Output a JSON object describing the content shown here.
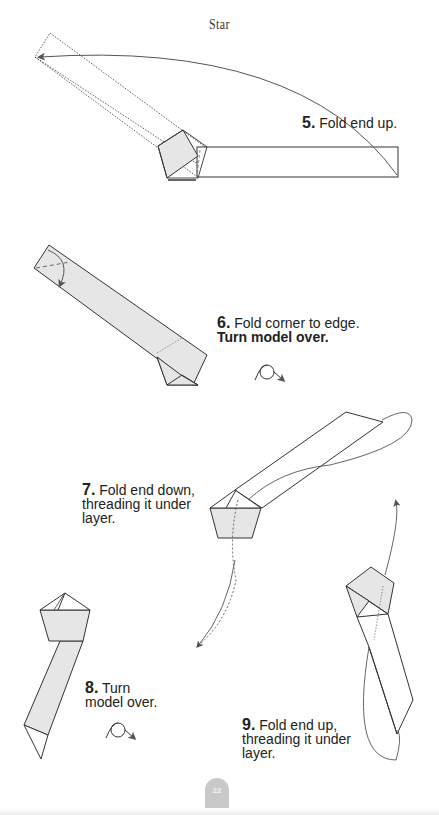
{
  "page": {
    "title": "Star",
    "page_number": "22"
  },
  "steps": [
    {
      "number": "5.",
      "text": "Fold end up.",
      "extra": ""
    },
    {
      "number": "6.",
      "text": "Fold corner to edge.",
      "extra": "Turn model over."
    },
    {
      "number": "7.",
      "lines": [
        "Fold end down,",
        "threading it under",
        "layer."
      ]
    },
    {
      "number": "8.",
      "lines": [
        "Turn",
        "model over."
      ]
    },
    {
      "number": "9.",
      "lines": [
        "Fold end up,",
        "threading it under",
        "layer."
      ]
    }
  ],
  "icons": {
    "turn_over": "turn-over-icon"
  },
  "colors": {
    "paper_fill": "#e6e6e6",
    "line": "#333333",
    "arrow": "#555555",
    "page_tab": "#c9c9c9"
  }
}
